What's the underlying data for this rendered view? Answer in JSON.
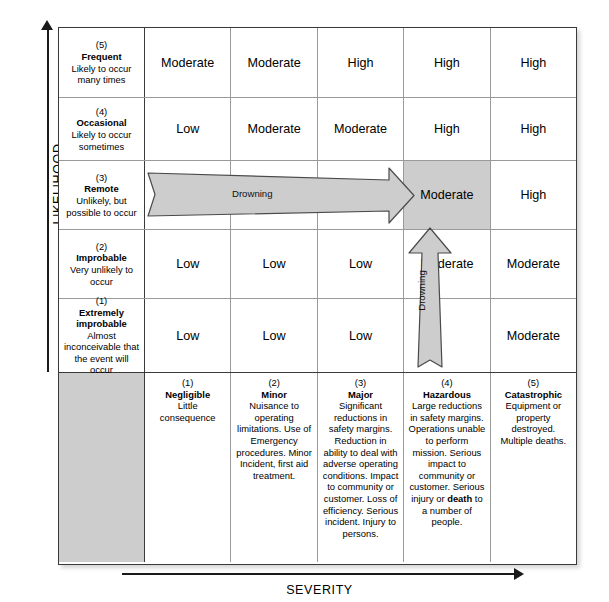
{
  "axes": {
    "y_label": "LIKELIHOOD",
    "x_label": "SEVERITY"
  },
  "likelihood_levels": [
    {
      "number": "(5)",
      "name": "Frequent",
      "description": "Likely to occur many times"
    },
    {
      "number": "(4)",
      "name": "Occasional",
      "description": "Likely to occur sometimes"
    },
    {
      "number": "(3)",
      "name": "Remote",
      "description": "Unlikely, but possible to occur"
    },
    {
      "number": "(2)",
      "name": "Improbable",
      "description": "Very unlikely to occur"
    },
    {
      "number": "(1)",
      "name": "Extremely improbable",
      "description": "Almost inconceivable that the event will occur"
    }
  ],
  "severity_levels": [
    {
      "number": "(1)",
      "name": "Negligible",
      "description": "Little consequence"
    },
    {
      "number": "(2)",
      "name": "Minor",
      "description": "Nuisance to operating limitations. Use of Emergency procedures. Minor Incident, first aid treatment."
    },
    {
      "number": "(3)",
      "name": "Major",
      "description": "Significant reductions in safety margins. Reduction in ability to deal with adverse operating conditions. Impact to community or customer. Loss of efficiency. Serious incident. Injury to persons."
    },
    {
      "number": "(4)",
      "name": "Hazardous",
      "description_part1": "Large reductions in safety margins. Operations unable to perform mission. Serious impact to community or customer. Serious injury or ",
      "description_bold": "death",
      "description_part2": " to a number of people."
    },
    {
      "number": "(5)",
      "name": "Catastrophic",
      "description": "Equipment or property destroyed. Multiple deaths."
    }
  ],
  "matrix": {
    "rows": [
      {
        "likelihood": "(5) Frequent",
        "cells": [
          "Moderate",
          "Moderate",
          "High",
          "High",
          "High"
        ]
      },
      {
        "likelihood": "(4) Occasional",
        "cells": [
          "Low",
          "Moderate",
          "Moderate",
          "High",
          "High"
        ]
      },
      {
        "likelihood": "(3) Remote",
        "cells": [
          "",
          "",
          "",
          "Moderate",
          "High"
        ]
      },
      {
        "likelihood": "(2) Improbable",
        "cells": [
          "Low",
          "Low",
          "Low",
          "Moderate",
          "Moderate"
        ]
      },
      {
        "likelihood": "(1) Extremely improbable",
        "cells": [
          "Low",
          "Low",
          "Low",
          "",
          "Moderate"
        ]
      }
    ],
    "highlighted_cell": "row-3-col-4-Moderate"
  },
  "annotations": {
    "horizontal_arrow_label": "Drowning",
    "vertical_arrow_label": "Drowning"
  },
  "colors": {
    "shaded_cell": "#cdcdcd",
    "arrow_fill": "#cdcdcd",
    "arrow_stroke": "#4a4a4a",
    "grid_line": "#9a9a9a",
    "border": "#3a3a3a"
  }
}
